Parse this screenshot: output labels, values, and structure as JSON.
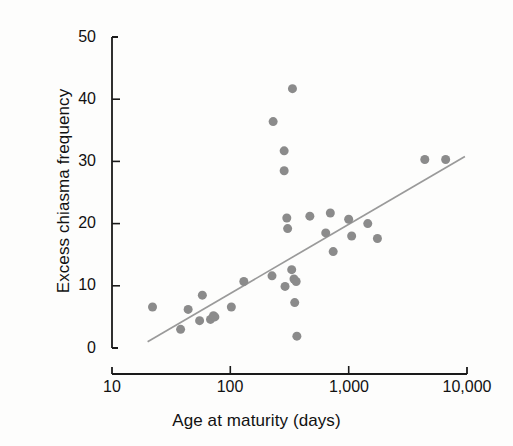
{
  "chart_data": {
    "type": "scatter",
    "title": "",
    "xlabel": "Age at maturity (days)",
    "ylabel": "Excess chiasma frequency",
    "xscale": "log",
    "yscale": "linear",
    "xlim": [
      10,
      10000
    ],
    "ylim": [
      0,
      50
    ],
    "grid": false,
    "legend": null,
    "x_tick_labels": [
      "10",
      "100",
      "1,000",
      "10,000"
    ],
    "x_tick_values": [
      10,
      100,
      1000,
      10000
    ],
    "y_tick_labels": [
      "0",
      "10",
      "20",
      "30",
      "40",
      "50"
    ],
    "y_tick_values": [
      0,
      10,
      20,
      30,
      40,
      50
    ],
    "point_color": "#8b8b8b",
    "line_color": "#9a9a9a",
    "axis_color": "#1a1a1a",
    "marker": "circle",
    "marker_size_px": 9,
    "series": [
      {
        "name": "Species",
        "type": "scatter",
        "points": [
          {
            "x": 22,
            "y": 6.6
          },
          {
            "x": 38,
            "y": 3.0
          },
          {
            "x": 44,
            "y": 6.2
          },
          {
            "x": 55,
            "y": 4.4
          },
          {
            "x": 58,
            "y": 8.5
          },
          {
            "x": 68,
            "y": 4.6
          },
          {
            "x": 72,
            "y": 5.2
          },
          {
            "x": 74,
            "y": 5.0
          },
          {
            "x": 102,
            "y": 6.6
          },
          {
            "x": 130,
            "y": 10.7
          },
          {
            "x": 225,
            "y": 11.6
          },
          {
            "x": 230,
            "y": 36.4
          },
          {
            "x": 285,
            "y": 31.7
          },
          {
            "x": 285,
            "y": 28.5
          },
          {
            "x": 290,
            "y": 9.9
          },
          {
            "x": 300,
            "y": 20.9
          },
          {
            "x": 305,
            "y": 19.2
          },
          {
            "x": 330,
            "y": 12.6
          },
          {
            "x": 335,
            "y": 41.7
          },
          {
            "x": 345,
            "y": 11.1
          },
          {
            "x": 350,
            "y": 7.3
          },
          {
            "x": 360,
            "y": 10.7
          },
          {
            "x": 365,
            "y": 1.9
          },
          {
            "x": 470,
            "y": 21.2
          },
          {
            "x": 640,
            "y": 18.5
          },
          {
            "x": 700,
            "y": 21.7
          },
          {
            "x": 740,
            "y": 15.5
          },
          {
            "x": 1000,
            "y": 20.7
          },
          {
            "x": 1060,
            "y": 18.0
          },
          {
            "x": 1450,
            "y": 20.0
          },
          {
            "x": 1750,
            "y": 17.6
          },
          {
            "x": 4400,
            "y": 30.3
          },
          {
            "x": 6600,
            "y": 30.3
          }
        ]
      },
      {
        "name": "Regression line",
        "type": "line",
        "points": [
          {
            "x": 20,
            "y": 1.0
          },
          {
            "x": 9600,
            "y": 30.8
          }
        ]
      }
    ]
  },
  "axes": {
    "y_title": "Excess chiasma frequency",
    "x_title": "Age at maturity (days)"
  }
}
